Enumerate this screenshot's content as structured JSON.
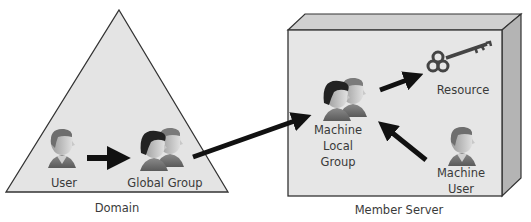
{
  "diagram": {
    "domain": {
      "label": "Domain",
      "shape": "triangle",
      "nodes": {
        "user": {
          "label": "User",
          "icon": "person-icon"
        },
        "global_group": {
          "label": "Global Group",
          "icon": "group-icon"
        }
      }
    },
    "member_server": {
      "label": "Member Server",
      "shape": "3d-box",
      "nodes": {
        "machine_local_group": {
          "label": "Machine\nLocal\nGroup",
          "icon": "group-icon"
        },
        "resource": {
          "label": "Resource",
          "icon": "key-icon"
        },
        "machine_user": {
          "label": "Machine\nUser",
          "icon": "person-icon"
        }
      }
    },
    "edges": [
      {
        "from": "User",
        "to": "Global Group"
      },
      {
        "from": "Global Group",
        "to": "Machine Local Group"
      },
      {
        "from": "Machine User",
        "to": "Machine Local Group"
      },
      {
        "from": "Machine Local Group",
        "to": "Resource"
      }
    ],
    "colors": {
      "shape_fill": "#e4e4e4",
      "box_top": "#d0d0d0",
      "box_side": "#b4b4b4",
      "outline": "#333333",
      "arrow": "#111111",
      "text": "#3a3a3a"
    }
  }
}
